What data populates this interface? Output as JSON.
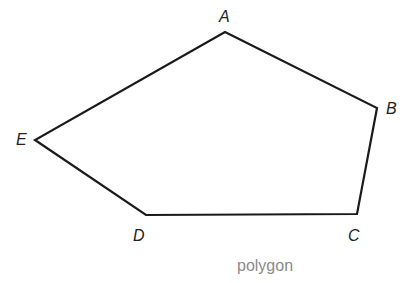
{
  "diagram": {
    "caption": "polygon",
    "stroke_color": "#1a1a1a",
    "caption_color": "#8a8a8a",
    "vertices": [
      {
        "label": "A",
        "x": 225,
        "y": 32
      },
      {
        "label": "B",
        "x": 377,
        "y": 108
      },
      {
        "label": "C",
        "x": 357,
        "y": 214
      },
      {
        "label": "D",
        "x": 146,
        "y": 215
      },
      {
        "label": "E",
        "x": 35,
        "y": 140
      }
    ]
  }
}
